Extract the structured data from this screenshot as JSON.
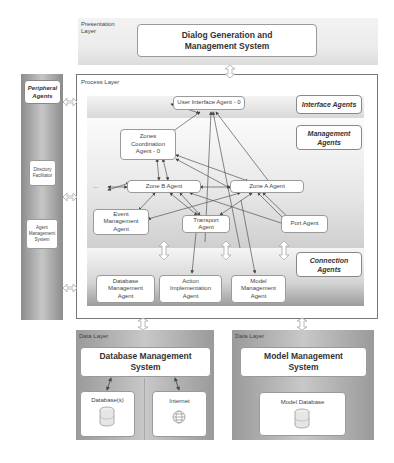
{
  "presentation_layer": {
    "label": "Presentation Layer",
    "system": "Dialog Generation and Management System"
  },
  "peripheral": {
    "title": "Peripheral Agents",
    "items": [
      "Directory Facilitator",
      "Agent Management System"
    ]
  },
  "process_layer": {
    "label": "Process Layer",
    "categories": {
      "interface": "Interface Agents",
      "management": "Management Agents",
      "connection": "Connection Agents"
    },
    "agents": {
      "user_interface": "User Interface Agent - 0",
      "zones_coordination": "Zones Coordination Agent - 0",
      "zone_b": "Zone B Agent",
      "zone_a": "Zone A Agent",
      "ellipsis": "...",
      "event_management": "Event Management Agent",
      "transport": "Transport Agent",
      "port": "Port Agent",
      "database_management": "Database Management Agent",
      "action_implementation": "Action Implementation Agent",
      "model_management": "Model Management Agent"
    }
  },
  "data_layers": [
    {
      "label": "Data Layer",
      "system": "Database Management System",
      "stores": [
        {
          "label": "Database(s)",
          "icon": "database-icon"
        },
        {
          "label": "Internet",
          "icon": "globe-icon"
        }
      ]
    },
    {
      "label": "Data Layer",
      "system": "Model Management System",
      "stores": [
        {
          "label": "Model Database",
          "icon": "database-icon"
        }
      ]
    }
  ]
}
